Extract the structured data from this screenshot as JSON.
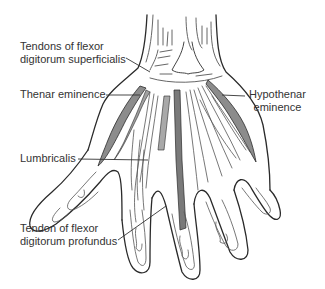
{
  "diagram": {
    "colors": {
      "outline": "#2a2a2a",
      "muscle_fill": "#8c8c8c",
      "tendon_fill": "#7a7a7a",
      "light_line": "#555555",
      "label_text": "#333333",
      "background": "#ffffff"
    },
    "labels": [
      {
        "id": "fds",
        "line1": "Tendons of flexor",
        "line2": "digitorum superficialis"
      },
      {
        "id": "thenar",
        "line1": "Thenar eminence",
        "line2": ""
      },
      {
        "id": "hypothenar",
        "line1": "Hypothenar",
        "line2": "eminence"
      },
      {
        "id": "lumbricalis",
        "line1": "Lumbricalis",
        "line2": ""
      },
      {
        "id": "fdp",
        "line1": "Tendon of flexor",
        "line2": "digitorum profundus"
      }
    ]
  }
}
